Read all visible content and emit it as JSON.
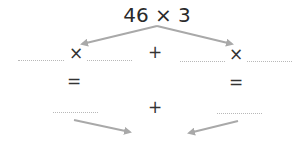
{
  "expression": "46 × 3",
  "symbols": {
    "times": "×",
    "plus": "+",
    "equals": "="
  },
  "colors": {
    "arrow": "#a9a9a9",
    "dots": "#b8b8b8",
    "text": "#2a2a2a"
  }
}
